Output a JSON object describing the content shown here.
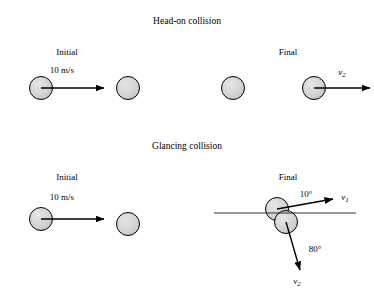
{
  "figure": {
    "panels": [
      {
        "title": "Head-on collision",
        "labels": {
          "initial": "Initial",
          "final": "Final",
          "speed": "10 m/s",
          "final_velocity_symbol": "v",
          "final_velocity_subscript": "2"
        }
      },
      {
        "title": "Glancing collision",
        "labels": {
          "initial": "Initial",
          "final": "Final",
          "speed": "10 m/s",
          "angle_upper": "10°",
          "angle_lower": "80°",
          "velocity1_symbol": "v",
          "velocity1_subscript": "1",
          "velocity2_symbol": "v",
          "velocity2_subscript": "2"
        }
      }
    ],
    "colors": {
      "ball_fill": "#d4d4d4",
      "ball_stroke": "#000000",
      "arrow": "#000000",
      "axis_line": "#000000",
      "background": "#ffffff"
    }
  }
}
